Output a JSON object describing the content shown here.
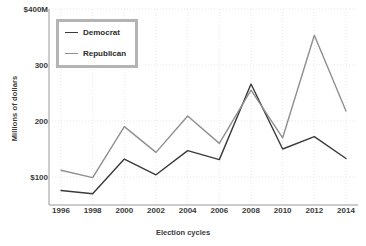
{
  "chart_data": {
    "type": "line",
    "title": "",
    "xlabel": "Election cycles",
    "ylabel": "Millions of dollars",
    "categories": [
      "1996",
      "1998",
      "2000",
      "2002",
      "2004",
      "2006",
      "2008",
      "2010",
      "2012",
      "2014"
    ],
    "x": [
      1996,
      1998,
      2000,
      2002,
      2004,
      2006,
      2008,
      2010,
      2012,
      2014
    ],
    "series": [
      {
        "name": "Democrat",
        "color": "#3a3a3a",
        "values": [
          76,
          70,
          132,
          104,
          147,
          131,
          266,
          150,
          172,
          133
        ]
      },
      {
        "name": "Republican",
        "color": "#8f8f8f",
        "values": [
          112,
          99,
          190,
          144,
          209,
          160,
          255,
          170,
          353,
          218
        ]
      }
    ],
    "ylim": [
      50,
      400
    ],
    "xlim": [
      1995,
      2015
    ],
    "yticks": [
      100,
      200,
      300,
      400
    ],
    "ytick_labels": [
      "$100",
      "200",
      "300",
      "$400M"
    ],
    "grid": true,
    "grid_style": "dotted",
    "grid_color": "#e8e8e8",
    "legend_position": "upper-left",
    "legend_entries": [
      "Democrat",
      "Republican"
    ]
  },
  "axes": {
    "x_title": "Election cycles",
    "y_title": "Millions of dollars"
  }
}
